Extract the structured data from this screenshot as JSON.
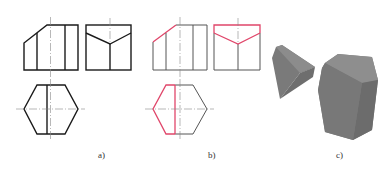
{
  "figure": {
    "panels": [
      {
        "id": "a",
        "label": "a)",
        "description": "Three orthographic views of a hexagonal prism cut by planes (black)"
      },
      {
        "id": "b",
        "label": "b)",
        "description": "Same views with cut lines highlighted in red"
      },
      {
        "id": "c",
        "label": "c)",
        "description": "Isometric rendering of the cut solid and the removed piece"
      }
    ],
    "colors": {
      "line": "#1a1a1a",
      "thin_line": "#555555",
      "highlight": "#e0466a",
      "center_line": "#888888",
      "solid_dark": "#6e6e6e",
      "solid_mid": "#7e7e7e",
      "solid_light": "#9a9a9a"
    }
  }
}
